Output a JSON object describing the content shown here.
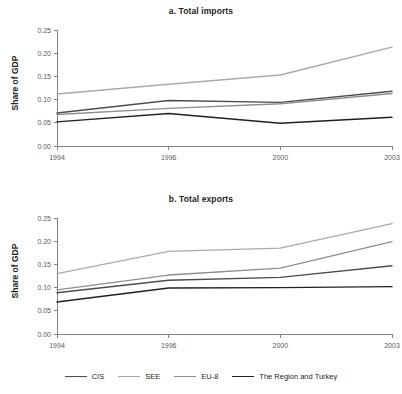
{
  "figure": {
    "ylabel": "Share of GDP",
    "background": "#ffffff"
  },
  "legend": {
    "position": "bottom-center",
    "items": [
      {
        "label": "CIS",
        "color": "#4d4d4d"
      },
      {
        "label": "SEE",
        "color": "#a7a9ac"
      },
      {
        "label": "EU-8",
        "color": "#8c8e90"
      },
      {
        "label": "The Region and Turkey",
        "color": "#231f20"
      }
    ]
  },
  "chart_data": [
    {
      "type": "line",
      "title": "a. Total imports",
      "xlabel": "",
      "ylabel": "Share of GDP",
      "categories": [
        "1994",
        "1996",
        "2000",
        "2003"
      ],
      "x": [
        1994,
        1996,
        2000,
        2003
      ],
      "ylim": [
        0.0,
        0.25
      ],
      "yticks": [
        0.0,
        0.05,
        0.1,
        0.15,
        0.2,
        0.25
      ],
      "ytick_labels": [
        "0.00",
        "0.05",
        "0.10",
        "0.15",
        "0.20",
        "0.25"
      ],
      "grid": false,
      "series": [
        {
          "name": "CIS",
          "color": "#4d4d4d",
          "values": [
            0.071,
            0.098,
            0.094,
            0.118
          ]
        },
        {
          "name": "SEE",
          "color": "#a7a9ac",
          "values": [
            0.112,
            0.133,
            0.153,
            0.213
          ]
        },
        {
          "name": "EU-8",
          "color": "#8c8e90",
          "values": [
            0.068,
            0.081,
            0.091,
            0.113
          ]
        },
        {
          "name": "The Region and Turkey",
          "color": "#231f20",
          "values": [
            0.052,
            0.07,
            0.049,
            0.062
          ]
        }
      ]
    },
    {
      "type": "line",
      "title": "b. Total exports",
      "xlabel": "",
      "ylabel": "Share of GDP",
      "categories": [
        "1994",
        "1996",
        "2000",
        "2003"
      ],
      "x": [
        1994,
        1996,
        2000,
        2003
      ],
      "ylim": [
        0.0,
        0.25
      ],
      "yticks": [
        0.0,
        0.05,
        0.1,
        0.15,
        0.2,
        0.25
      ],
      "ytick_labels": [
        "0.00",
        "0.05",
        "0.10",
        "0.15",
        "0.20",
        "0.25"
      ],
      "grid": false,
      "series": [
        {
          "name": "CIS",
          "color": "#4d4d4d",
          "values": [
            0.089,
            0.116,
            0.122,
            0.147
          ]
        },
        {
          "name": "SEE",
          "color": "#a7a9ac",
          "values": [
            0.13,
            0.178,
            0.185,
            0.238
          ]
        },
        {
          "name": "EU-8",
          "color": "#8c8e90",
          "values": [
            0.095,
            0.127,
            0.142,
            0.199
          ]
        },
        {
          "name": "The Region and Turkey",
          "color": "#231f20",
          "values": [
            0.069,
            0.099,
            0.1,
            0.102
          ]
        }
      ]
    }
  ]
}
